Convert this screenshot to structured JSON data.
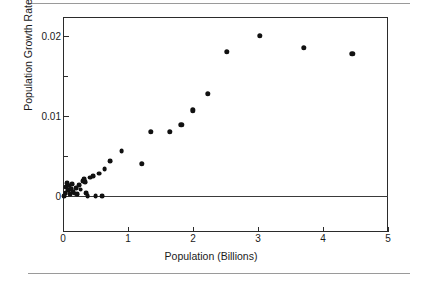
{
  "figure": {
    "has_top_rule": true,
    "has_bottom_rule": true,
    "background": "#ffffff",
    "marker_color": "#111111",
    "axis_color": "#2b2b2b"
  },
  "chart_data": {
    "type": "scatter",
    "title": "",
    "xlabel": "Population (Billions)",
    "ylabel": "Population Growth Rate",
    "xlim": [
      0,
      5
    ],
    "ylim": [
      -0.0045,
      0.0224
    ],
    "grid": false,
    "legend": null,
    "xticks": [
      0,
      1,
      2,
      3,
      4,
      5
    ],
    "xticklabels": [
      "0",
      "1",
      "2",
      "3",
      "4",
      "5"
    ],
    "yticks": [
      0,
      0.01,
      0.02
    ],
    "yticklabels": [
      "0",
      "0.01",
      "0.02"
    ],
    "yminorticks": [
      0.005,
      0.015
    ],
    "zero_line": 0,
    "points": [
      {
        "x": 0.02,
        "y": 0.0
      },
      {
        "x": 0.04,
        "y": 0.0004
      },
      {
        "x": 0.05,
        "y": 0.0011
      },
      {
        "x": 0.06,
        "y": 0.0016
      },
      {
        "x": 0.08,
        "y": 0.0007
      },
      {
        "x": 0.09,
        "y": 0.0013
      },
      {
        "x": 0.11,
        "y": 0.0002
      },
      {
        "x": 0.12,
        "y": 0.0009
      },
      {
        "x": 0.14,
        "y": 0.0015
      },
      {
        "x": 0.16,
        "y": 0.0005
      },
      {
        "x": 0.18,
        "y": 0.0003
      },
      {
        "x": 0.2,
        "y": 0.001
      },
      {
        "x": 0.22,
        "y": 0.0002
      },
      {
        "x": 0.25,
        "y": 0.0014
      },
      {
        "x": 0.27,
        "y": 0.0008
      },
      {
        "x": 0.3,
        "y": 0.0019
      },
      {
        "x": 0.32,
        "y": 0.0021
      },
      {
        "x": 0.34,
        "y": 0.0017
      },
      {
        "x": 0.36,
        "y": 0.0004
      },
      {
        "x": 0.38,
        "y": 0.0
      },
      {
        "x": 0.42,
        "y": 0.0023
      },
      {
        "x": 0.46,
        "y": 0.0025
      },
      {
        "x": 0.5,
        "y": 0.0
      },
      {
        "x": 0.56,
        "y": 0.0028
      },
      {
        "x": 0.6,
        "y": 0.0
      },
      {
        "x": 0.64,
        "y": 0.0034
      },
      {
        "x": 0.73,
        "y": 0.0044
      },
      {
        "x": 0.9,
        "y": 0.0056
      },
      {
        "x": 1.21,
        "y": 0.004
      },
      {
        "x": 1.35,
        "y": 0.008
      },
      {
        "x": 1.64,
        "y": 0.008
      },
      {
        "x": 1.82,
        "y": 0.0089
      },
      {
        "x": 2.0,
        "y": 0.0107
      },
      {
        "x": 2.23,
        "y": 0.0128
      },
      {
        "x": 2.52,
        "y": 0.018
      },
      {
        "x": 3.03,
        "y": 0.02
      },
      {
        "x": 3.7,
        "y": 0.0185
      },
      {
        "x": 4.45,
        "y": 0.0178
      }
    ]
  }
}
